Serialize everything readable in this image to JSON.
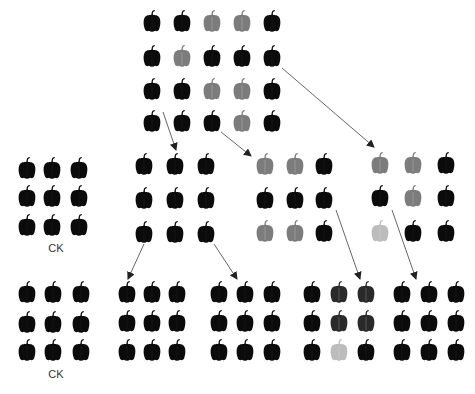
{
  "colors": {
    "B": "#0b0b0b",
    "D": "#2a2a2a",
    "G": "#7c7c7c",
    "L": "#bcbcbc",
    "arrow": "#555555",
    "label": "#333333"
  },
  "pepper_size": {
    "w": 20,
    "h": 25
  },
  "groups": [
    {
      "id": "top-parent",
      "xs": [
        152,
        182,
        212,
        242,
        272
      ],
      "ys": [
        20,
        55,
        88,
        120
      ],
      "grid": [
        [
          "B",
          "B",
          "G",
          "G",
          "B"
        ],
        [
          "B",
          "G",
          "B",
          "B",
          "B"
        ],
        [
          "B",
          "B",
          "G",
          "G",
          "B"
        ],
        [
          "B",
          "B",
          "B",
          "G",
          "B"
        ]
      ]
    },
    {
      "id": "middle-ck",
      "label": "CK",
      "label_pos": [
        56,
        242
      ],
      "xs": [
        27,
        52,
        79
      ],
      "ys": [
        167,
        195,
        224
      ],
      "grid": [
        [
          "B",
          "B",
          "B"
        ],
        [
          "B",
          "B",
          "B"
        ],
        [
          "B",
          "B",
          "B"
        ]
      ]
    },
    {
      "id": "middle-b",
      "xs": [
        144,
        175,
        206
      ],
      "ys": [
        163,
        197,
        231
      ],
      "grid": [
        [
          "B",
          "B",
          "B"
        ],
        [
          "B",
          "B",
          "B"
        ],
        [
          "B",
          "B",
          "B"
        ]
      ]
    },
    {
      "id": "middle-c",
      "xs": [
        265,
        295,
        324
      ],
      "ys": [
        163,
        197,
        230
      ],
      "grid": [
        [
          "G",
          "G",
          "B"
        ],
        [
          "B",
          "B",
          "B"
        ],
        [
          "G",
          "G",
          "B"
        ]
      ]
    },
    {
      "id": "middle-d",
      "xs": [
        380,
        413,
        446
      ],
      "ys": [
        162,
        195,
        230
      ],
      "grid": [
        [
          "G",
          "G",
          "B"
        ],
        [
          "B",
          "G",
          "B"
        ],
        [
          "L",
          "B",
          "B"
        ]
      ]
    },
    {
      "id": "bottom-ck",
      "label": "CK",
      "label_pos": [
        56,
        368
      ],
      "xs": [
        27,
        53,
        81
      ],
      "ys": [
        291,
        321,
        349
      ],
      "grid": [
        [
          "B",
          "B",
          "B"
        ],
        [
          "B",
          "B",
          "B"
        ],
        [
          "B",
          "B",
          "B"
        ]
      ]
    },
    {
      "id": "bottom-2",
      "xs": [
        127,
        152,
        177
      ],
      "ys": [
        291,
        320,
        349
      ],
      "grid": [
        [
          "B",
          "B",
          "B"
        ],
        [
          "B",
          "B",
          "B"
        ],
        [
          "B",
          "B",
          "B"
        ]
      ]
    },
    {
      "id": "bottom-3",
      "xs": [
        219,
        245,
        272
      ],
      "ys": [
        291,
        320,
        349
      ],
      "grid": [
        [
          "B",
          "B",
          "B"
        ],
        [
          "B",
          "B",
          "B"
        ],
        [
          "B",
          "B",
          "B"
        ]
      ]
    },
    {
      "id": "bottom-4",
      "xs": [
        312,
        339,
        366
      ],
      "ys": [
        291,
        320,
        349
      ],
      "grid": [
        [
          "B",
          "D",
          "D"
        ],
        [
          "B",
          "D",
          "D"
        ],
        [
          "B",
          "L",
          "B"
        ]
      ]
    },
    {
      "id": "bottom-5",
      "xs": [
        402,
        429,
        456
      ],
      "ys": [
        291,
        320,
        349
      ],
      "grid": [
        [
          "B",
          "B",
          "B"
        ],
        [
          "B",
          "B",
          "B"
        ],
        [
          "B",
          "B",
          "B"
        ]
      ]
    }
  ],
  "arrows": [
    {
      "from": [
        163,
        112
      ],
      "to": [
        176,
        150
      ]
    },
    {
      "from": [
        221,
        132
      ],
      "to": [
        251,
        156
      ]
    },
    {
      "from": [
        282,
        68
      ],
      "to": [
        374,
        147
      ]
    },
    {
      "from": [
        144,
        244
      ],
      "to": [
        128,
        279
      ]
    },
    {
      "from": [
        214,
        244
      ],
      "to": [
        237,
        279
      ]
    },
    {
      "from": [
        336,
        210
      ],
      "to": [
        360,
        279
      ]
    },
    {
      "from": [
        392,
        210
      ],
      "to": [
        416,
        279
      ]
    }
  ]
}
